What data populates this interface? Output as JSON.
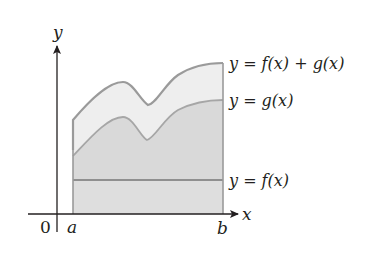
{
  "diagram": {
    "axes": {
      "y_label": "y",
      "x_label": "x",
      "origin_label": "0"
    },
    "interval": {
      "left_label": "a",
      "right_label": "b"
    },
    "curves": [
      {
        "id": "sum",
        "label": "y = f(x) + g(x)"
      },
      {
        "id": "g",
        "label": "y = g(x)"
      },
      {
        "id": "f",
        "label": "y = f(x)"
      }
    ],
    "colors": {
      "axis": "#231f20",
      "curve_stroke": "#9a9a9a",
      "fill_top_band": "#ececec",
      "fill_g_region": "#d6d6d6",
      "fill_f_region": "#dcdcdc",
      "text": "#231f20"
    }
  }
}
